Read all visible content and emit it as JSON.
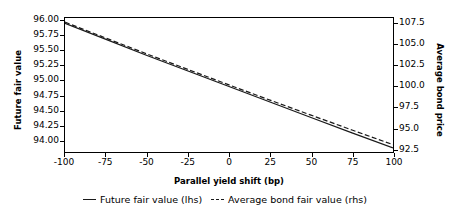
{
  "chart_data": {
    "type": "line",
    "title": "",
    "xlabel": "Parallel yield shift (bp)",
    "ylabel": "Future fair value",
    "ylabel_right": "Average bond price",
    "grid": false,
    "legend_position": "below",
    "xlim": [
      -100,
      100
    ],
    "ylim": [
      93.8,
      96.05
    ],
    "ylim_right": [
      92.1,
      108.2
    ],
    "xticks": [
      "-100",
      "-75",
      "-50",
      "-25",
      "0",
      "25",
      "50",
      "75",
      "100"
    ],
    "xtick_values": [
      -100,
      -75,
      -50,
      -25,
      0,
      25,
      50,
      75,
      100
    ],
    "yticks_left": [
      "96.00",
      "95.75",
      "95.50",
      "95.25",
      "95.00",
      "94.75",
      "94.50",
      "94.25",
      "94.00"
    ],
    "ytick_left_values": [
      96.0,
      95.75,
      95.5,
      95.25,
      95.0,
      94.75,
      94.5,
      94.25,
      94.0
    ],
    "yticks_right": [
      "107.5",
      "105.0",
      "102.5",
      "100.0",
      "97.5",
      "95.0",
      "92.5"
    ],
    "ytick_right_values": [
      107.5,
      105.0,
      102.5,
      100.0,
      97.5,
      95.0,
      92.5
    ],
    "x": [
      -100,
      -75,
      -50,
      -25,
      0,
      25,
      50,
      75,
      100
    ],
    "series": [
      {
        "name": "Future fair value (lhs)",
        "axis": "left",
        "style": "solid",
        "color": "#1a1a1a",
        "values": [
          95.96,
          95.69,
          95.42,
          95.16,
          94.9,
          94.64,
          94.38,
          94.12,
          93.87
        ]
      },
      {
        "name": "Average bond fair value (rhs)",
        "axis": "right",
        "style": "dashed",
        "color": "#1a1a1a",
        "values": [
          107.7,
          105.78,
          103.88,
          102.01,
          100.16,
          98.33,
          96.53,
          94.74,
          92.98
        ]
      }
    ],
    "legend": [
      {
        "label": "Future fair value (lhs)",
        "style": "solid",
        "color": "#1a1a1a"
      },
      {
        "label": "Average bond fair value (rhs)",
        "style": "dashed",
        "color": "#1a1a1a"
      }
    ]
  }
}
